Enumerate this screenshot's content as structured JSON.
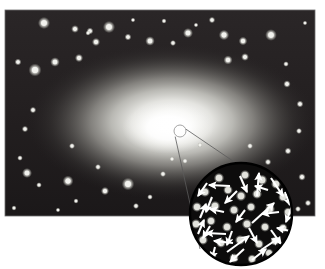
{
  "figure": {
    "type": "astronomy-illustration",
    "canvas": {
      "width": 325,
      "height": 269,
      "background": "#ffffff"
    }
  },
  "colors": {
    "page_background": "#ffffff",
    "field_dark": "#231f20",
    "field_dark_edge": "#171415",
    "glow_core": "#ffffff",
    "glow_mid": "#d8d8d4",
    "glow_outer": "#8a8882",
    "star_fill": "#f2f2ee",
    "star_halo": "#b9b9b2",
    "inset_fill": "#0d0c0c",
    "inset_border": "#000000",
    "arrow_color": "#ffffff",
    "callout_line": "#5a5a5a",
    "callout_circle": "#9a9a9a"
  },
  "field": {
    "name": "galaxy-star-field",
    "x": 5,
    "y": 10,
    "width": 310,
    "height": 206
  },
  "glow": {
    "name": "elliptical-galaxy-glow",
    "center_x": 172,
    "center_y": 122,
    "radius_x": 145,
    "radius_y": 78,
    "core_x": 168,
    "core_y": 128,
    "core_radius_x": 46,
    "core_radius_y": 26
  },
  "callout": {
    "small_circle": {
      "cx": 180,
      "cy": 131,
      "r": 6
    },
    "inset_circle": {
      "cx": 241,
      "cy": 214,
      "r": 51
    },
    "leader_lines": [
      {
        "x1": 175.2,
        "y1": 136.6,
        "x2": 200.0,
        "y2": 249.0
      },
      {
        "x1": 186.0,
        "y1": 129.2,
        "x2": 289.0,
        "y2": 199.0
      }
    ]
  },
  "stars": [
    {
      "x": 44,
      "y": 23,
      "r": 2.8
    },
    {
      "x": 75,
      "y": 29,
      "r": 1.8
    },
    {
      "x": 90,
      "y": 31,
      "r": 1.6
    },
    {
      "x": 88,
      "y": 33,
      "r": 1.2
    },
    {
      "x": 96,
      "y": 42,
      "r": 1.9
    },
    {
      "x": 109,
      "y": 27,
      "r": 2.8
    },
    {
      "x": 128,
      "y": 37,
      "r": 1.6
    },
    {
      "x": 133,
      "y": 20,
      "r": 1.1
    },
    {
      "x": 150,
      "y": 41,
      "r": 2.2
    },
    {
      "x": 164,
      "y": 21,
      "r": 1.2
    },
    {
      "x": 173,
      "y": 43,
      "r": 1.4
    },
    {
      "x": 188,
      "y": 33,
      "r": 2.3
    },
    {
      "x": 196,
      "y": 25,
      "r": 1.1
    },
    {
      "x": 212,
      "y": 20,
      "r": 1.5
    },
    {
      "x": 224,
      "y": 35,
      "r": 2.4
    },
    {
      "x": 243,
      "y": 41,
      "r": 2.0
    },
    {
      "x": 245,
      "y": 57,
      "r": 1.8
    },
    {
      "x": 271,
      "y": 35,
      "r": 2.7
    },
    {
      "x": 228,
      "y": 60,
      "r": 2.1
    },
    {
      "x": 286,
      "y": 64,
      "r": 1.3
    },
    {
      "x": 305,
      "y": 23,
      "r": 1.1
    },
    {
      "x": 18,
      "y": 62,
      "r": 1.6
    },
    {
      "x": 35,
      "y": 70,
      "r": 3.0
    },
    {
      "x": 55,
      "y": 62,
      "r": 2.2
    },
    {
      "x": 79,
      "y": 58,
      "r": 1.9
    },
    {
      "x": 33,
      "y": 110,
      "r": 1.5
    },
    {
      "x": 287,
      "y": 84,
      "r": 1.7
    },
    {
      "x": 300,
      "y": 104,
      "r": 1.6
    },
    {
      "x": 25,
      "y": 129,
      "r": 1.5
    },
    {
      "x": 20,
      "y": 158,
      "r": 1.3
    },
    {
      "x": 27,
      "y": 173,
      "r": 2.3
    },
    {
      "x": 39,
      "y": 185,
      "r": 1.3
    },
    {
      "x": 68,
      "y": 181,
      "r": 2.5
    },
    {
      "x": 72,
      "y": 146,
      "r": 1.4
    },
    {
      "x": 76,
      "y": 201,
      "r": 1.2
    },
    {
      "x": 98,
      "y": 167,
      "r": 1.4
    },
    {
      "x": 105,
      "y": 191,
      "r": 1.9
    },
    {
      "x": 128,
      "y": 184,
      "r": 2.9
    },
    {
      "x": 136,
      "y": 206,
      "r": 1.4
    },
    {
      "x": 150,
      "y": 197,
      "r": 1.3
    },
    {
      "x": 163,
      "y": 174,
      "r": 1.4
    },
    {
      "x": 172,
      "y": 159,
      "r": 1.2
    },
    {
      "x": 185,
      "y": 161,
      "r": 1.3
    },
    {
      "x": 200,
      "y": 145,
      "r": 1.2
    },
    {
      "x": 250,
      "y": 146,
      "r": 1.4
    },
    {
      "x": 268,
      "y": 162,
      "r": 1.5
    },
    {
      "x": 288,
      "y": 151,
      "r": 1.6
    },
    {
      "x": 299,
      "y": 131,
      "r": 1.4
    },
    {
      "x": 302,
      "y": 177,
      "r": 1.7
    },
    {
      "x": 308,
      "y": 203,
      "r": 1.5
    },
    {
      "x": 298,
      "y": 209,
      "r": 1.4
    },
    {
      "x": 14,
      "y": 208,
      "r": 1.2
    },
    {
      "x": 58,
      "y": 210,
      "r": 1.1
    }
  ],
  "inset_stars": [
    {
      "x": 219,
      "y": 178,
      "r": 3.1
    },
    {
      "x": 245,
      "y": 175,
      "r": 3.0
    },
    {
      "x": 262,
      "y": 180,
      "r": 3.2
    },
    {
      "x": 276,
      "y": 184,
      "r": 3.0
    },
    {
      "x": 205,
      "y": 192,
      "r": 3.0
    },
    {
      "x": 228,
      "y": 190,
      "r": 2.9
    },
    {
      "x": 241,
      "y": 196,
      "r": 3.1
    },
    {
      "x": 257,
      "y": 194,
      "r": 3.0
    },
    {
      "x": 283,
      "y": 197,
      "r": 2.9
    },
    {
      "x": 197,
      "y": 207,
      "r": 3.0
    },
    {
      "x": 215,
      "y": 206,
      "r": 3.1
    },
    {
      "x": 234,
      "y": 210,
      "r": 3.0
    },
    {
      "x": 251,
      "y": 207,
      "r": 2.9
    },
    {
      "x": 270,
      "y": 209,
      "r": 3.0
    },
    {
      "x": 288,
      "y": 212,
      "r": 2.8
    },
    {
      "x": 196,
      "y": 224,
      "r": 3.0
    },
    {
      "x": 211,
      "y": 221,
      "r": 2.9
    },
    {
      "x": 227,
      "y": 227,
      "r": 3.0
    },
    {
      "x": 247,
      "y": 224,
      "r": 3.1
    },
    {
      "x": 265,
      "y": 227,
      "r": 2.9
    },
    {
      "x": 283,
      "y": 228,
      "r": 2.8
    },
    {
      "x": 203,
      "y": 240,
      "r": 3.0
    },
    {
      "x": 221,
      "y": 243,
      "r": 2.9
    },
    {
      "x": 240,
      "y": 240,
      "r": 3.0
    },
    {
      "x": 259,
      "y": 244,
      "r": 2.9
    },
    {
      "x": 275,
      "y": 241,
      "r": 2.8
    },
    {
      "x": 212,
      "y": 256,
      "r": 2.8
    },
    {
      "x": 234,
      "y": 258,
      "r": 2.9
    },
    {
      "x": 252,
      "y": 259,
      "r": 2.8
    },
    {
      "x": 269,
      "y": 253,
      "r": 2.7
    }
  ],
  "inset_arrows": [
    {
      "x1": 230,
      "y1": 186,
      "x2": 209,
      "y2": 185
    },
    {
      "x1": 240,
      "y1": 176,
      "x2": 247,
      "y2": 192
    },
    {
      "x1": 257,
      "y1": 196,
      "x2": 259,
      "y2": 173
    },
    {
      "x1": 271,
      "y1": 178,
      "x2": 283,
      "y2": 196
    },
    {
      "x1": 212,
      "y1": 197,
      "x2": 206,
      "y2": 212
    },
    {
      "x1": 237,
      "y1": 191,
      "x2": 225,
      "y2": 203
    },
    {
      "x1": 285,
      "y1": 192,
      "x2": 290,
      "y2": 205
    },
    {
      "x1": 200,
      "y1": 218,
      "x2": 206,
      "y2": 204
    },
    {
      "x1": 224,
      "y1": 212,
      "x2": 210,
      "y2": 209
    },
    {
      "x1": 245,
      "y1": 210,
      "x2": 236,
      "y2": 222
    },
    {
      "x1": 252,
      "y1": 223,
      "x2": 274,
      "y2": 203
    },
    {
      "x1": 279,
      "y1": 212,
      "x2": 262,
      "y2": 214
    },
    {
      "x1": 292,
      "y1": 206,
      "x2": 286,
      "y2": 222
    },
    {
      "x1": 198,
      "y1": 234,
      "x2": 204,
      "y2": 220
    },
    {
      "x1": 210,
      "y1": 226,
      "x2": 203,
      "y2": 238
    },
    {
      "x1": 232,
      "y1": 231,
      "x2": 227,
      "y2": 245
    },
    {
      "x1": 249,
      "y1": 228,
      "x2": 257,
      "y2": 243
    },
    {
      "x1": 271,
      "y1": 230,
      "x2": 281,
      "y2": 244
    },
    {
      "x1": 226,
      "y1": 234,
      "x2": 206,
      "y2": 233
    },
    {
      "x1": 233,
      "y1": 243,
      "x2": 214,
      "y2": 241
    },
    {
      "x1": 215,
      "y1": 247,
      "x2": 212,
      "y2": 259
    },
    {
      "x1": 227,
      "y1": 252,
      "x2": 249,
      "y2": 236
    },
    {
      "x1": 244,
      "y1": 249,
      "x2": 230,
      "y2": 262
    },
    {
      "x1": 261,
      "y1": 250,
      "x2": 279,
      "y2": 238
    },
    {
      "x1": 290,
      "y1": 231,
      "x2": 277,
      "y2": 228
    },
    {
      "x1": 207,
      "y1": 183,
      "x2": 198,
      "y2": 196
    },
    {
      "x1": 252,
      "y1": 260,
      "x2": 266,
      "y2": 249
    },
    {
      "x1": 268,
      "y1": 190,
      "x2": 255,
      "y2": 186
    }
  ]
}
